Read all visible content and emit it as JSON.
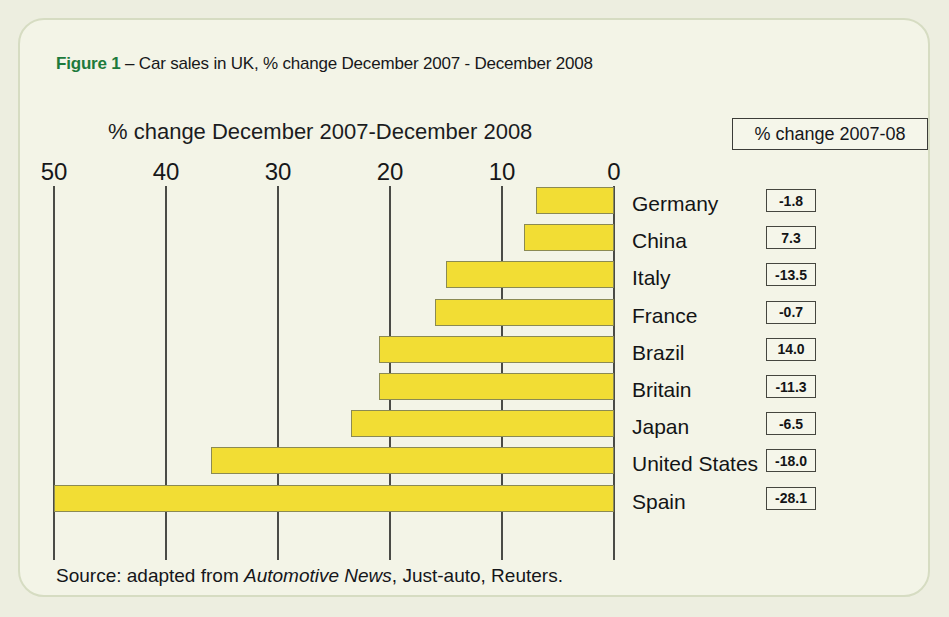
{
  "figure": {
    "number_label": "Figure 1",
    "dash": "–",
    "caption": "Car sales in UK, % change December 2007 - December 2008"
  },
  "chart_subtitle": "% change December 2007-December 2008",
  "legend": {
    "label": "% change 2007-08"
  },
  "source": {
    "prefix": "Source: adapted from ",
    "italic": "Automotive News",
    "suffix": ", Just-auto, Reuters."
  },
  "colors": {
    "bar_fill": "#f2dd34",
    "bar_border": "#8b8a53",
    "panel_bg": "#f3f4e7",
    "panel_border": "#d6dcc2",
    "figure_number": "#1d7a3c",
    "axis": "#4a4b46"
  },
  "chart_data": {
    "type": "bar",
    "title": "Car sales in UK, % change December 2007 - December 2008",
    "subtitle": "% change December 2007-December 2008",
    "orientation": "horizontal",
    "xlabel": "% change December 2007-December 2008",
    "ylabel": "",
    "axis_reversed": true,
    "xlim": [
      50,
      0
    ],
    "ticks": [
      "50",
      "40",
      "30",
      "20",
      "10",
      "0"
    ],
    "tick_values": [
      50,
      40,
      30,
      20,
      10,
      0
    ],
    "grid": true,
    "legend_position": "top-right",
    "legend_label": "% change 2007-08",
    "categories": [
      "Germany",
      "China",
      "Italy",
      "France",
      "Brazil",
      "Britain",
      "Japan",
      "United States",
      "Spain"
    ],
    "bar_magnitudes": [
      7,
      8,
      15,
      16,
      21,
      21,
      23.5,
      36,
      50
    ],
    "annotation_series_name": "% change 2007-08",
    "annotation_values": [
      "-1.8",
      "7.3",
      "-13.5",
      "-0.7",
      "14.0",
      "-11.3",
      "-6.5",
      "-18.0",
      "-28.1"
    ],
    "rows": [
      {
        "country": "Germany",
        "bar_magnitude": 7,
        "value_label": "-1.8"
      },
      {
        "country": "China",
        "bar_magnitude": 8,
        "value_label": "7.3"
      },
      {
        "country": "Italy",
        "bar_magnitude": 15,
        "value_label": "-13.5"
      },
      {
        "country": "France",
        "bar_magnitude": 16,
        "value_label": "-0.7"
      },
      {
        "country": "Brazil",
        "bar_magnitude": 21,
        "value_label": "14.0"
      },
      {
        "country": "Britain",
        "bar_magnitude": 21,
        "value_label": "-11.3"
      },
      {
        "country": "Japan",
        "bar_magnitude": 23.5,
        "value_label": "-6.5"
      },
      {
        "country": "United States",
        "bar_magnitude": 36,
        "value_label": "-18.0"
      },
      {
        "country": "Spain",
        "bar_magnitude": 50,
        "value_label": "-28.1"
      }
    ]
  }
}
